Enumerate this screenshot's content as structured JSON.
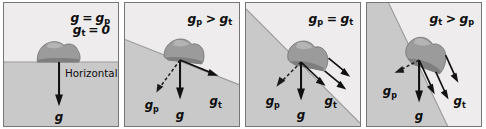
{
  "figure": {
    "name": "gravity-components-on-slopes",
    "background": "#ffffff",
    "colors": {
      "sky": "#eeecec",
      "ground": "#c9c9c9",
      "slope_line": "#9a9a9a",
      "vector": "#111111",
      "border": "#767676",
      "rock": "#9b9b9b",
      "text": "#0d0d0d"
    }
  },
  "panels": [
    {
      "id": "panel-1",
      "slope_degrees": 0,
      "equation": {
        "line1": {
          "var": "g",
          "op": "=",
          "rhs_var": "g",
          "rhs_sub": "p"
        },
        "line2": {
          "var": "g",
          "sub": "t",
          "op": "=",
          "rhs": "0"
        }
      },
      "annotation": "Horizontal",
      "vectors": [
        {
          "name": "g",
          "label": "g",
          "sub": "",
          "style": "solid",
          "direction": "down"
        }
      ],
      "labels": [
        {
          "text": "g",
          "sub": ""
        }
      ]
    },
    {
      "id": "panel-2",
      "slope_degrees": 20,
      "equation": {
        "line1": {
          "var": "g",
          "sub": "p",
          "op": ">",
          "rhs_var": "g",
          "rhs_sub": "t"
        }
      },
      "annotation": "",
      "vectors": [
        {
          "name": "g",
          "label": "g",
          "sub": "",
          "style": "solid",
          "direction": "down"
        },
        {
          "name": "g-tangential",
          "label": "g",
          "sub": "t",
          "style": "solid",
          "direction": "downslope"
        },
        {
          "name": "g-perpendicular",
          "label": "g",
          "sub": "p",
          "style": "dashed",
          "direction": "perpendicular"
        }
      ],
      "labels": [
        {
          "text": "g",
          "sub": "p"
        },
        {
          "text": "g",
          "sub": ""
        },
        {
          "text": "g",
          "sub": "t"
        }
      ]
    },
    {
      "id": "panel-3",
      "slope_degrees": 45,
      "equation": {
        "line1": {
          "var": "g",
          "sub": "p",
          "op": "=",
          "rhs_var": "g",
          "rhs_sub": "t"
        }
      },
      "annotation": "",
      "vectors": [
        {
          "name": "g",
          "label": "g",
          "sub": "",
          "style": "solid",
          "direction": "down"
        },
        {
          "name": "g-tangential",
          "label": "g",
          "sub": "t",
          "style": "solid",
          "direction": "downslope"
        },
        {
          "name": "g-perpendicular",
          "label": "g",
          "sub": "p",
          "style": "dashed",
          "direction": "perpendicular"
        }
      ],
      "labels": [
        {
          "text": "g",
          "sub": "p"
        },
        {
          "text": "g",
          "sub": ""
        },
        {
          "text": "g",
          "sub": "t"
        }
      ]
    },
    {
      "id": "panel-4",
      "slope_degrees": 62,
      "equation": {
        "line1": {
          "var": "g",
          "sub": "t",
          "op": ">",
          "rhs_var": "g",
          "rhs_sub": "p"
        }
      },
      "annotation": "",
      "vectors": [
        {
          "name": "g",
          "label": "g",
          "sub": "",
          "style": "solid",
          "direction": "down"
        },
        {
          "name": "g-tangential",
          "label": "g",
          "sub": "t",
          "style": "solid",
          "direction": "downslope"
        },
        {
          "name": "g-perpendicular",
          "label": "g",
          "sub": "p",
          "style": "dashed",
          "direction": "perpendicular"
        }
      ],
      "labels": [
        {
          "text": "g",
          "sub": "p"
        },
        {
          "text": "g",
          "sub": ""
        },
        {
          "text": "g",
          "sub": "t"
        }
      ]
    }
  ],
  "text": {
    "p1_eq1_g": "g",
    "p1_eq1_op": "=",
    "p1_eq1_rhs": "g",
    "p1_eq1_rhs_sub": "p",
    "p1_eq2_g": "g",
    "p1_eq2_sub": "t",
    "p1_eq2_op": "=",
    "p1_eq2_rhs": "0",
    "p1_horizontal": "Horizontal",
    "p1_g": "g",
    "p2_eq_lhs": "g",
    "p2_eq_lhs_sub": "p",
    "p2_eq_op": ">",
    "p2_eq_rhs": "g",
    "p2_eq_rhs_sub": "t",
    "p2_gp": "g",
    "p2_gp_sub": "p",
    "p2_g": "g",
    "p2_gt": "g",
    "p2_gt_sub": "t",
    "p3_eq_lhs": "g",
    "p3_eq_lhs_sub": "p",
    "p3_eq_op": "=",
    "p3_eq_rhs": "g",
    "p3_eq_rhs_sub": "t",
    "p3_gp": "g",
    "p3_gp_sub": "p",
    "p3_g": "g",
    "p3_gt": "g",
    "p3_gt_sub": "t",
    "p4_eq_lhs": "g",
    "p4_eq_lhs_sub": "t",
    "p4_eq_op": ">",
    "p4_eq_rhs": "g",
    "p4_eq_rhs_sub": "p",
    "p4_gp": "g",
    "p4_gp_sub": "p",
    "p4_g": "g",
    "p4_gt": "g",
    "p4_gt_sub": "t"
  }
}
